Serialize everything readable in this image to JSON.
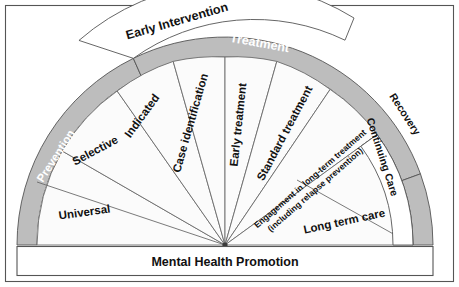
{
  "diagram": {
    "base_label": "Mental Health Promotion",
    "colors": {
      "band_gray": "#bdbdbd",
      "band_white": "#ffffff",
      "wedge_fill": "#fbfbfb",
      "line": "#6b6b6b",
      "text_dark": "#111111",
      "text_light": "#ffffff"
    },
    "outer_bands": [
      {
        "id": "prevention",
        "label": "Prevention",
        "style": "gray",
        "text_color": "#ffffff"
      },
      {
        "id": "treatment",
        "label": "Treatment",
        "style": "gray",
        "text_color": "#ffffff"
      },
      {
        "id": "recovery",
        "label": "Recovery",
        "style": "gray",
        "text_color": "#111111"
      }
    ],
    "overlay_bands": [
      {
        "id": "early-intervention",
        "label": "Early Intervention",
        "style": "white",
        "text_color": "#111111"
      },
      {
        "id": "continuing-care",
        "label": "Continuing Care",
        "style": "white",
        "text_color": "#111111"
      }
    ],
    "wedges": [
      {
        "id": "universal",
        "label": "Universal"
      },
      {
        "id": "selective",
        "label": "Selective"
      },
      {
        "id": "indicated",
        "label": "Indicated"
      },
      {
        "id": "case-identification",
        "label": "Case identification"
      },
      {
        "id": "early-treatment",
        "label": "Early treatment"
      },
      {
        "id": "standard-treatment",
        "label": "Standard treatment"
      },
      {
        "id": "engagement-long-term",
        "label": "Engagement in long-term treatment",
        "label_line2": "(including relapse prevention)"
      },
      {
        "id": "long-term-care",
        "label": "Long term care"
      }
    ]
  }
}
